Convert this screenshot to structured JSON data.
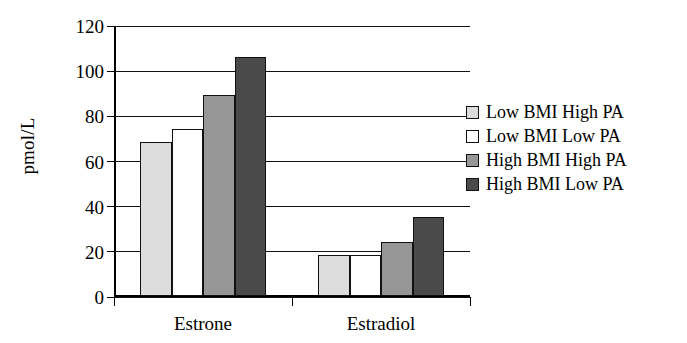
{
  "chart_data": {
    "type": "bar",
    "title": "",
    "subtitle": "",
    "xlabel": "",
    "ylabel": "pmol/L",
    "ylim": [
      0,
      120
    ],
    "ytick_labels": [
      "120",
      "100",
      "80",
      "60",
      "40",
      "20",
      "0"
    ],
    "ytick_values": [
      120,
      100,
      80,
      60,
      40,
      20,
      0
    ],
    "grid": true,
    "legend_position": "right",
    "categories": [
      "Estrone",
      "Estradiol"
    ],
    "series": [
      {
        "name": "Low BMI High PA",
        "color": "#dcdcdc",
        "values": [
          68,
          18
        ]
      },
      {
        "name": "Low BMI Low PA",
        "color": "#ffffff",
        "values": [
          74,
          18
        ]
      },
      {
        "name": "High BMI High PA",
        "color": "#969696",
        "values": [
          89,
          24
        ]
      },
      {
        "name": "High BMI Low PA",
        "color": "#4a4a4a",
        "values": [
          106,
          35
        ]
      }
    ]
  },
  "axis": {
    "y_title": "pmol/L",
    "tick_0": "0",
    "tick_20": "20",
    "tick_40": "40",
    "tick_60": "60",
    "tick_80": "80",
    "tick_100": "100",
    "tick_120": "120",
    "cat_1": "Estrone",
    "cat_2": "Estradiol"
  },
  "legend": {
    "items": [
      {
        "label": "Low BMI High PA",
        "color": "#dcdcdc"
      },
      {
        "label": "Low BMI Low PA",
        "color": "#ffffff"
      },
      {
        "label": "High BMI High PA",
        "color": "#969696"
      },
      {
        "label": "High BMI Low PA",
        "color": "#4a4a4a"
      }
    ]
  }
}
